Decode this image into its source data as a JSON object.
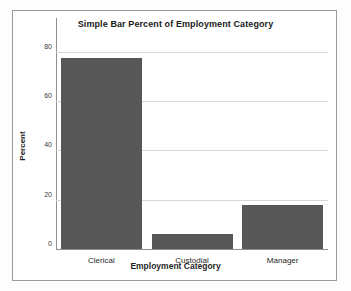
{
  "chart_data": {
    "type": "bar",
    "title": "Simple Bar Percent of Employment Category",
    "xlabel": "Employment Category",
    "ylabel": "Percent",
    "categories": [
      "Clerical",
      "Custodial",
      "Manager"
    ],
    "values": [
      77.5,
      6.1,
      18.0
    ],
    "ylim": [
      0,
      88
    ],
    "yticks": [
      0,
      20,
      40,
      60,
      80
    ],
    "ytick_labels": [
      "0",
      "20",
      "40",
      "60",
      "80"
    ],
    "grid": true,
    "legend": false,
    "bar_color": "#575757",
    "gridline_color": "#d6d6dd",
    "axis_color": "#8f8f8f",
    "frame_border_color": "#9a9a9a",
    "background_color": "#ffffff"
  }
}
